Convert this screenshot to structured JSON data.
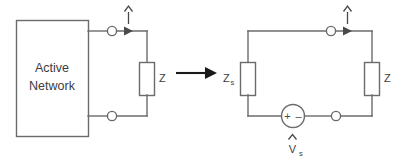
{
  "figure": {
    "type": "circuit-diagram"
  },
  "left_circuit": {
    "name": "active-network-circuit",
    "block_label_line1": "Active",
    "block_label_line2": "Network",
    "load_label": "Z",
    "current_label": "I",
    "current_hat": "^",
    "terminal_count": 2
  },
  "transform_arrow": {
    "label": "",
    "direction": "right",
    "color": "#1a1a1a"
  },
  "right_circuit": {
    "name": "thevenin-equivalent-circuit",
    "source_impedance_label": "Z",
    "source_impedance_sub": "s",
    "load_label": "Z",
    "current_label": "I",
    "current_hat": "^",
    "source_label": "V",
    "source_sub": "s",
    "source_hat": "^",
    "source_plus": "+",
    "source_minus": "–",
    "terminal_count": 2
  },
  "colors": {
    "wire": "#6b6b6b",
    "text": "#3d3d3d",
    "arrow": "#1a1a1a",
    "background": "#ffffff"
  }
}
